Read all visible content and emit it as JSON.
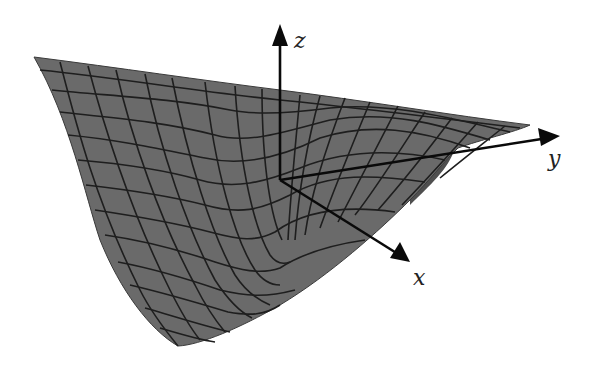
{
  "figure": {
    "colors": {
      "surface": "#6a6a6a",
      "underside": "#4f4f4f",
      "gridlines": "#1e1e1e",
      "axes": "#0a0a0a",
      "background": "#ffffff"
    },
    "axes": {
      "z": {
        "label": "z"
      },
      "y": {
        "label": "y"
      },
      "x": {
        "label": "x"
      }
    }
  }
}
